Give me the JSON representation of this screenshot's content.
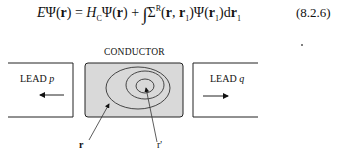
{
  "equation": {
    "text": "EΨ(r) = H_CΨ(r) + ∫Σ^R(r, r₁)Ψ(r₁)dr₁",
    "lhs": "EΨ(",
    "r": "r",
    "mid1": ") = H",
    "subC": "C",
    "mid2": "Ψ(",
    "plus": ") + ∫Σ",
    "supR": "R",
    "args": "(r, r",
    "sub1": "1",
    "close": ")Ψ(r",
    "sub2": "1",
    "d": ")dr",
    "sub3": "1",
    "number": "(8.2.6)"
  },
  "figure": {
    "conductor_label": "CONDUCTOR",
    "lead_left": {
      "name": "LEAD",
      "var": "p"
    },
    "lead_right": {
      "name": "LEAD",
      "var": "q"
    },
    "point_r": "r",
    "point_r1": "r'",
    "colors": {
      "conductor_fill": "#d9d9d9",
      "stroke": "#222222"
    }
  }
}
